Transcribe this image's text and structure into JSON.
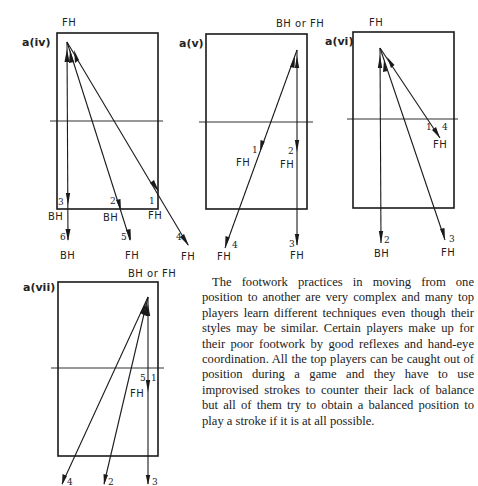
{
  "diagrams": [
    {
      "id": "a(iv)",
      "title": "a(iv)",
      "top_label": "FH",
      "segments": [
        {
          "number": "1",
          "label": "FH",
          "stroke": "forehand"
        },
        {
          "number": "2",
          "label": "BH",
          "stroke": "backhand"
        },
        {
          "number": "3",
          "label": "BH",
          "stroke": "backhand"
        },
        {
          "number": "4",
          "label": "FH",
          "stroke": "forehand"
        },
        {
          "number": "5",
          "label": "FH",
          "stroke": "forehand"
        },
        {
          "number": "6",
          "label": "BH",
          "stroke": "backhand"
        }
      ]
    },
    {
      "id": "a(v)",
      "title": "a(v)",
      "top_label": "BH or FH",
      "segments": [
        {
          "number": "1",
          "label": "FH"
        },
        {
          "number": "2",
          "label": "FH"
        },
        {
          "number": "3",
          "label": "FH"
        },
        {
          "number": "4",
          "label": "FH"
        }
      ]
    },
    {
      "id": "a(vi)",
      "title": "a(vi)",
      "top_label": "FH",
      "segments": [
        {
          "number": "1",
          "label": "FH"
        },
        {
          "number": "2",
          "label": "BH"
        },
        {
          "number": "3",
          "label": "FH"
        },
        {
          "number": "4",
          "label": "FH"
        }
      ]
    },
    {
      "id": "a(vii)",
      "title": "a(vii)",
      "top_label": "BH or FH",
      "segments": [
        {
          "number": "1",
          "label": "FH"
        },
        {
          "number": "2",
          "label": ""
        },
        {
          "number": "3",
          "label": ""
        },
        {
          "number": "4",
          "label": ""
        },
        {
          "number": "5",
          "label": "FH"
        }
      ]
    }
  ],
  "body_text": "The footwork practices in moving from one position to another are very complex and many top players learn different techniques even though their styles may be similar. Certain players make up for their poor footwork by good reflexes and hand-eye coordination. All the top players can be caught out of position during a game and they have to use improvised strokes to counter their lack of balance but all of them try to obtain a balanced position to play a stroke if it is at all possible."
}
